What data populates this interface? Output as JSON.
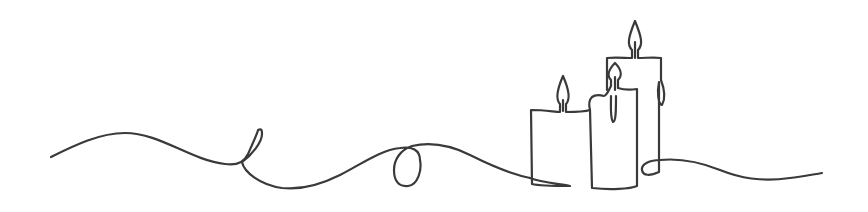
{
  "illustration": {
    "description": "Continuous single-line drawing of three lit candles with a looping wavy line",
    "background_color": "#ffffff",
    "stroke_color": "#3a3a3a",
    "candles": [
      {
        "name": "short-candle",
        "flame": "lit"
      },
      {
        "name": "middle-candle",
        "flame": "lit",
        "drip": true
      },
      {
        "name": "tall-candle",
        "flame": "lit",
        "drip": true
      }
    ],
    "loops": 3
  }
}
